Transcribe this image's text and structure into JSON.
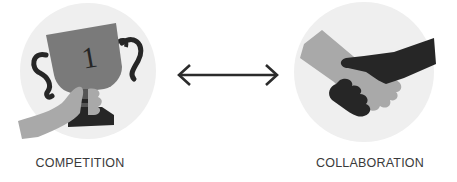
{
  "diagram": {
    "left": {
      "label": "COMPETITION",
      "icon": "trophy-hand-icon",
      "trophy_number": "1"
    },
    "connector": {
      "icon": "double-arrow-icon",
      "direction": "bidirectional"
    },
    "right": {
      "label": "COLLABORATION",
      "icon": "handshake-icon"
    },
    "colors": {
      "circle_bg": "#efefef",
      "dark": "#262626",
      "mid": "#7a7a7a",
      "light": "#a9a9a9",
      "label": "#3a3a3a",
      "arrow": "#2b2b2b"
    }
  }
}
